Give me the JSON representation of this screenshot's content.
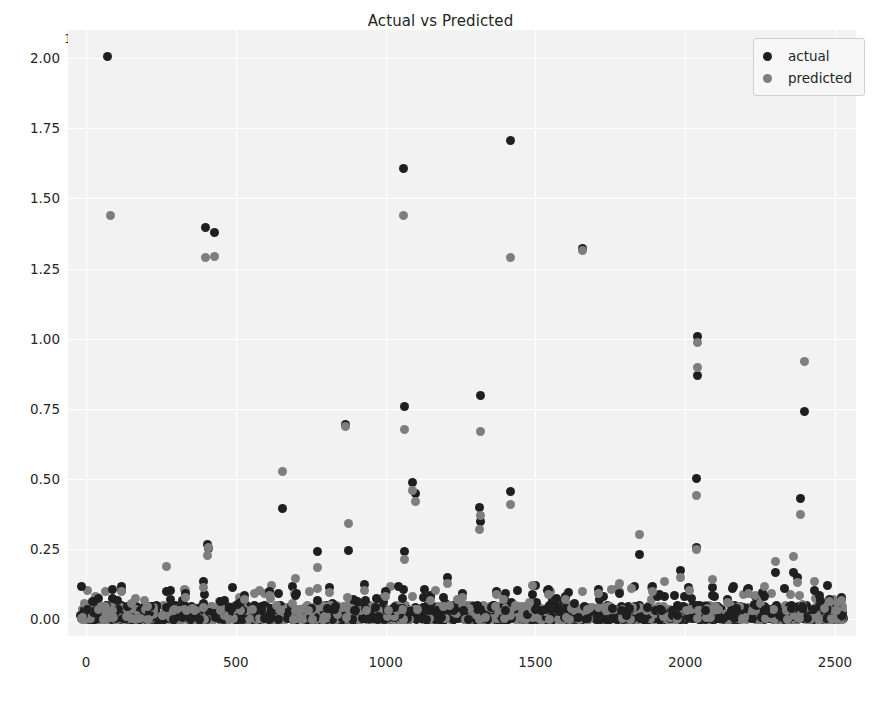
{
  "chart_data": {
    "type": "scatter",
    "title": "Actual vs Predicted",
    "xlabel": "",
    "ylabel": "",
    "y_offset_label": "1e7",
    "y_offset_multiplier": 10000000,
    "xlim": [
      -60,
      2570
    ],
    "ylim": [
      -600000,
      21000000
    ],
    "xticks": [
      0,
      500,
      1000,
      1500,
      2000,
      2500
    ],
    "xticklabels": [
      "0",
      "500",
      "1000",
      "1500",
      "2000",
      "2500"
    ],
    "yticks": [
      0,
      2500000,
      5000000,
      7500000,
      10000000,
      12500000,
      15000000,
      17500000,
      20000000
    ],
    "yticklabels": [
      "0.00",
      "0.25",
      "0.50",
      "0.75",
      "1.00",
      "1.25",
      "1.50",
      "1.75",
      "2.00"
    ],
    "grid": true,
    "grid_color": "#ffffff",
    "plot_bgcolor": "#f2f2f2",
    "legend_position": "upper right",
    "marker_size_px": 9,
    "series": [
      {
        "name": "actual",
        "color": "#1f1f1f",
        "points": [
          [
            70,
            20050000
          ],
          [
            398,
            13950000
          ],
          [
            428,
            13800000
          ],
          [
            1058,
            16080000
          ],
          [
            1418,
            17080000
          ],
          [
            1658,
            13200000
          ],
          [
            866,
            6950000
          ],
          [
            1063,
            7580000
          ],
          [
            1318,
            7980000
          ],
          [
            2042,
            10060000
          ],
          [
            2040,
            8700000
          ],
          [
            2398,
            7400000
          ],
          [
            1090,
            4880000
          ],
          [
            1098,
            4480000
          ],
          [
            1312,
            3980000
          ],
          [
            1418,
            4560000
          ],
          [
            2036,
            5000000
          ],
          [
            2385,
            4300000
          ],
          [
            655,
            3960000
          ],
          [
            772,
            2400000
          ],
          [
            876,
            2440000
          ],
          [
            1062,
            2420000
          ],
          [
            1318,
            3480000
          ],
          [
            404,
            2680000
          ],
          [
            410,
            2520000
          ],
          [
            1848,
            2320000
          ],
          [
            2038,
            2560000
          ],
          [
            1985,
            1720000
          ],
          [
            2300,
            1680000
          ],
          [
            2360,
            1660000
          ],
          [
            2375,
            1480000
          ],
          [
            118,
            1180000
          ],
          [
            268,
            1000000
          ],
          [
            332,
            900000
          ],
          [
            392,
            1330000
          ],
          [
            530,
            840000
          ],
          [
            612,
            980000
          ],
          [
            700,
            830000
          ],
          [
            812,
            1120000
          ],
          [
            930,
            1220000
          ],
          [
            1000,
            980000
          ],
          [
            1150,
            760000
          ],
          [
            1205,
            1480000
          ],
          [
            1258,
            900000
          ],
          [
            1370,
            1000000
          ],
          [
            1490,
            880000
          ],
          [
            1545,
            1060000
          ],
          [
            1600,
            790000
          ],
          [
            1710,
            1070000
          ],
          [
            1780,
            900000
          ],
          [
            1890,
            1170000
          ],
          [
            1930,
            800000
          ],
          [
            2090,
            840000
          ],
          [
            2140,
            700000
          ],
          [
            2210,
            1090000
          ],
          [
            2265,
            820000
          ],
          [
            2430,
            1020000
          ],
          [
            2480,
            700000
          ],
          [
            2520,
            780000
          ]
        ]
      },
      {
        "name": "predicted",
        "color": "#7e7e7e",
        "points": [
          [
            82,
            14380000
          ],
          [
            398,
            12900000
          ],
          [
            430,
            12930000
          ],
          [
            1058,
            14400000
          ],
          [
            1418,
            12900000
          ],
          [
            1658,
            13150000
          ],
          [
            866,
            6880000
          ],
          [
            1063,
            6760000
          ],
          [
            1318,
            6700000
          ],
          [
            2042,
            9850000
          ],
          [
            2040,
            8980000
          ],
          [
            2398,
            9180000
          ],
          [
            1090,
            4600000
          ],
          [
            1100,
            4180000
          ],
          [
            1312,
            3200000
          ],
          [
            1418,
            4080000
          ],
          [
            2036,
            4400000
          ],
          [
            2385,
            3720000
          ],
          [
            655,
            5280000
          ],
          [
            772,
            1860000
          ],
          [
            876,
            3420000
          ],
          [
            1062,
            2140000
          ],
          [
            1318,
            3700000
          ],
          [
            404,
            2260000
          ],
          [
            410,
            2540000
          ],
          [
            1848,
            3020000
          ],
          [
            2038,
            2480000
          ],
          [
            1985,
            1480000
          ],
          [
            2300,
            2060000
          ],
          [
            2360,
            2220000
          ],
          [
            2375,
            1320000
          ],
          [
            118,
            1000000
          ],
          [
            268,
            1880000
          ],
          [
            332,
            780000
          ],
          [
            392,
            1140000
          ],
          [
            530,
            720000
          ],
          [
            612,
            860000
          ],
          [
            700,
            1440000
          ],
          [
            812,
            960000
          ],
          [
            930,
            1040000
          ],
          [
            1000,
            820000
          ],
          [
            1150,
            650000
          ],
          [
            1205,
            1260000
          ],
          [
            1258,
            760000
          ],
          [
            1370,
            880000
          ],
          [
            1490,
            1200000
          ],
          [
            1545,
            880000
          ],
          [
            1600,
            690000
          ],
          [
            1710,
            920000
          ],
          [
            1780,
            1270000
          ],
          [
            1890,
            980000
          ],
          [
            1930,
            1340000
          ],
          [
            2090,
            1420000
          ],
          [
            2140,
            600000
          ],
          [
            2210,
            930000
          ],
          [
            2265,
            1180000
          ],
          [
            2430,
            1340000
          ],
          [
            2480,
            620000
          ],
          [
            2520,
            660000
          ]
        ]
      }
    ],
    "baseline_band": {
      "description": "dense mass of ~2500 near-zero points along y=0",
      "n_points": 2500,
      "y_range": [
        0,
        500000
      ]
    }
  },
  "legend": {
    "items": [
      {
        "label": "actual",
        "color": "#1f1f1f"
      },
      {
        "label": "predicted",
        "color": "#7e7e7e"
      }
    ]
  }
}
